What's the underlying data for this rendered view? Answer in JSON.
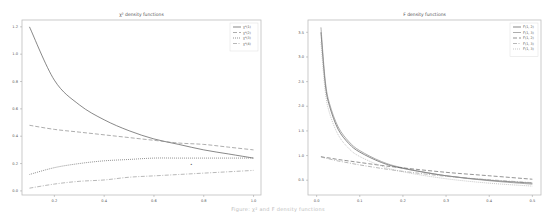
{
  "chart_data": [
    {
      "type": "line",
      "title": "χ² density functions",
      "xlabel": "",
      "ylabel": "",
      "xlim": [
        0.07,
        1.03
      ],
      "ylim": [
        -0.03,
        1.25
      ],
      "xticks": [
        "0.2",
        "0.4",
        "0.6",
        "0.8",
        "1.0"
      ],
      "yticks": [
        "0.0",
        "0.2",
        "0.4",
        "0.6",
        "0.8",
        "1.0",
        "1.2"
      ],
      "grid": false,
      "legend_position": "upper right",
      "x": [
        0.1,
        0.2,
        0.3,
        0.4,
        0.5,
        0.6,
        0.7,
        0.8,
        0.9,
        1.0
      ],
      "series": [
        {
          "name": "χ²(1)",
          "style": "solid",
          "values": [
            1.2,
            0.81,
            0.63,
            0.52,
            0.44,
            0.38,
            0.34,
            0.3,
            0.27,
            0.24
          ]
        },
        {
          "name": "χ²(2)",
          "style": "dashed",
          "values": [
            0.48,
            0.45,
            0.43,
            0.41,
            0.39,
            0.37,
            0.35,
            0.34,
            0.32,
            0.3
          ]
        },
        {
          "name": "χ²(3)",
          "style": "dotted",
          "values": [
            0.12,
            0.17,
            0.2,
            0.22,
            0.23,
            0.24,
            0.24,
            0.24,
            0.24,
            0.24
          ]
        },
        {
          "name": "χ²(4)",
          "style": "dashdot",
          "values": [
            0.02,
            0.05,
            0.07,
            0.08,
            0.1,
            0.11,
            0.12,
            0.13,
            0.14,
            0.15
          ]
        }
      ],
      "annotation": {
        "text": "▴",
        "x": 0.75,
        "y": 0.19
      }
    },
    {
      "type": "line",
      "title": "F density functions",
      "xlabel": "",
      "ylabel": "",
      "xlim": [
        -0.02,
        0.52
      ],
      "ylim": [
        0.2,
        3.75
      ],
      "xticks": [
        "0.0",
        "0.1",
        "0.2",
        "0.3",
        "0.4",
        "0.5"
      ],
      "yticks": [
        "0.5",
        "1.0",
        "1.5",
        "2.0",
        "2.5",
        "3.0",
        "3.5"
      ],
      "grid": false,
      "legend_position": "upper right",
      "x": [
        0.01,
        0.02,
        0.03,
        0.05,
        0.075,
        0.1,
        0.15,
        0.2,
        0.3,
        0.4,
        0.5
      ],
      "series": [
        {
          "name": "F(1, 2)",
          "style": "solid",
          "values": [
            3.5,
            2.45,
            2.0,
            1.53,
            1.24,
            1.07,
            0.86,
            0.74,
            0.59,
            0.5,
            0.44
          ]
        },
        {
          "name": "F(1, 3)",
          "style": "solid",
          "values": [
            3.6,
            2.52,
            2.05,
            1.58,
            1.28,
            1.1,
            0.88,
            0.75,
            0.59,
            0.49,
            0.42
          ]
        },
        {
          "name": "F(1, 2)",
          "style": "dashed",
          "values": [
            0.98,
            0.96,
            0.95,
            0.92,
            0.89,
            0.86,
            0.8,
            0.75,
            0.66,
            0.59,
            0.52
          ]
        },
        {
          "name": "F(1, 3)",
          "style": "dashdot",
          "values": [
            0.97,
            0.95,
            0.93,
            0.89,
            0.85,
            0.81,
            0.74,
            0.68,
            0.58,
            0.51,
            0.45
          ]
        },
        {
          "name": "F(1, 3)",
          "style": "dotted",
          "values": [
            3.3,
            2.3,
            1.86,
            1.42,
            1.14,
            0.98,
            0.79,
            0.67,
            0.53,
            0.44,
            0.38
          ]
        }
      ]
    }
  ],
  "caption": "Figure: χ² and F density functions"
}
